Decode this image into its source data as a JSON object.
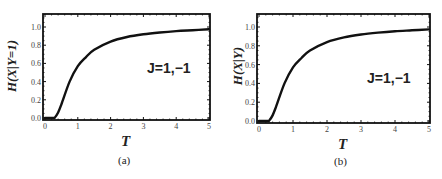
{
  "chart_data": [
    {
      "type": "line",
      "panel": "(a)",
      "title": "",
      "xlabel": "T",
      "ylabel": "H(X|Y=1)",
      "annotation": "J=1,−1",
      "xlim": [
        0,
        5
      ],
      "ylim": [
        0,
        1.1
      ],
      "xticks": [
        "0",
        "1",
        "2",
        "3",
        "4",
        "5"
      ],
      "yticks": [
        "0.0",
        "0.2",
        "0.4",
        "0.6",
        "0.8",
        "1.0"
      ],
      "grid": false,
      "series": [
        {
          "name": "H(X|Y=1)",
          "x": [
            0,
            0.25,
            0.3,
            0.4,
            0.5,
            0.75,
            1.0,
            1.25,
            1.5,
            2.0,
            2.5,
            3.0,
            3.5,
            4.0,
            4.5,
            5.0
          ],
          "y": [
            0,
            0,
            0.005,
            0.06,
            0.15,
            0.4,
            0.57,
            0.67,
            0.75,
            0.84,
            0.89,
            0.92,
            0.94,
            0.955,
            0.965,
            0.975
          ]
        }
      ]
    },
    {
      "type": "line",
      "panel": "(b)",
      "title": "",
      "xlabel": "T",
      "ylabel": "H(X|Y)",
      "annotation": "J=1,−1",
      "xlim": [
        0,
        5
      ],
      "ylim": [
        0,
        1.1
      ],
      "xticks": [
        "0",
        "1",
        "2",
        "3",
        "4",
        "5"
      ],
      "yticks": [
        "0.0",
        "0.2",
        "0.4",
        "0.6",
        "0.8",
        "1.0"
      ],
      "grid": false,
      "series": [
        {
          "name": "H(X|Y)",
          "x": [
            0,
            0.25,
            0.3,
            0.4,
            0.5,
            0.75,
            1.0,
            1.25,
            1.5,
            2.0,
            2.5,
            3.0,
            3.5,
            4.0,
            4.5,
            5.0
          ],
          "y": [
            0,
            0,
            0.005,
            0.06,
            0.15,
            0.4,
            0.57,
            0.67,
            0.75,
            0.84,
            0.89,
            0.92,
            0.94,
            0.955,
            0.965,
            0.975
          ]
        }
      ]
    }
  ],
  "panels": [
    {
      "caption": "(a)",
      "xlabel": "T",
      "ylabel": "H(X|Y=1)",
      "annotation": "J=1,−1"
    },
    {
      "caption": "(b)",
      "xlabel": "T",
      "ylabel": "H(X|Y)",
      "annotation": "J=1,−1"
    }
  ],
  "colors": {
    "line": "#111111",
    "frame": "#111111",
    "tick_text": "#444444"
  }
}
